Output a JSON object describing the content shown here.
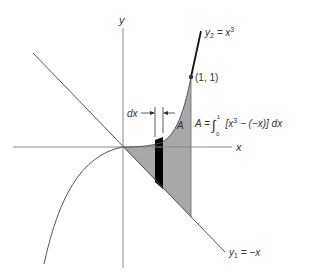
{
  "diagram": {
    "axes": {
      "x_label": "x",
      "y_label": "y"
    },
    "curves": {
      "y2": {
        "label_var": "y",
        "label_sub": "2",
        "label_eq": " = x",
        "label_sup": "3",
        "expression": "y2 = x^3"
      },
      "y1": {
        "label_var": "y",
        "label_sub": "1",
        "label_eq": " = −x",
        "expression": "y1 = -x"
      }
    },
    "point": {
      "label": "(1, 1)",
      "x": 1,
      "y": 1
    },
    "region_label": "A",
    "strip_label": "dx",
    "formula": {
      "lhs": "A =",
      "integral_sign": "∫",
      "lower": "0",
      "upper": "1",
      "integrand_a": "[x",
      "integrand_sup": "3",
      "integrand_b": " − (−x)] dx"
    },
    "colors": {
      "shade": "#a8a8a8",
      "strip": "#000000",
      "axis": "#888888",
      "line": "#555555",
      "curve_upper": "#111111"
    }
  }
}
